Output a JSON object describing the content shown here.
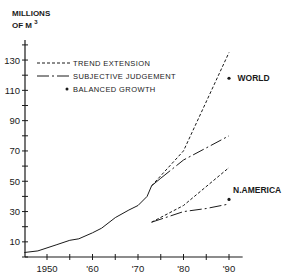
{
  "chart_data": {
    "type": "line",
    "title": "",
    "ylabel_line1": "MILLIONS",
    "ylabel_line2": "OF M",
    "ylabel_sup": "3",
    "xlabel": "",
    "xlim": [
      1945,
      1993
    ],
    "ylim": [
      0,
      150
    ],
    "grid": false,
    "x_ticks": [
      1950,
      1955,
      1960,
      1965,
      1970,
      1975,
      1980,
      1985,
      1990
    ],
    "x_tick_labels": [
      {
        "year": 1950,
        "label": "1950"
      },
      {
        "year": 1960,
        "label": "'60"
      },
      {
        "year": 1970,
        "label": "'70"
      },
      {
        "year": 1980,
        "label": "'80"
      },
      {
        "year": 1990,
        "label": "'90"
      }
    ],
    "y_ticks": [
      0,
      10,
      20,
      30,
      40,
      50,
      60,
      70,
      80,
      90,
      100,
      110,
      120,
      130,
      140
    ],
    "y_tick_labels": [
      10,
      30,
      50,
      70,
      90,
      110,
      130
    ],
    "legend": {
      "position": "upper-left",
      "entries": [
        {
          "style": "dashed",
          "label": "TREND EXTENSION"
        },
        {
          "style": "dash-dot",
          "label": "SUBJECTIVE JUDGEMENT"
        },
        {
          "style": "dot",
          "label": "BALANCED GROWTH"
        }
      ]
    },
    "series": [
      {
        "name": "World (historical)",
        "style": "solid",
        "x": [
          1945,
          1948,
          1950,
          1952,
          1955,
          1957,
          1960,
          1962,
          1965,
          1968,
          1970,
          1972,
          1973,
          1975
        ],
        "y": [
          3,
          4,
          6,
          8,
          11,
          12,
          16,
          19,
          26,
          31,
          34,
          40,
          47,
          52
        ]
      },
      {
        "name": "World - Trend extension",
        "style": "dashed",
        "x": [
          1973,
          1980,
          1990
        ],
        "y": [
          47,
          70,
          135
        ]
      },
      {
        "name": "World - Subjective judgement",
        "style": "dash-dot",
        "x": [
          1975,
          1980,
          1985,
          1990
        ],
        "y": [
          52,
          64,
          72,
          80
        ]
      },
      {
        "name": "World - Balanced growth",
        "style": "dot",
        "x": [
          1990
        ],
        "y": [
          118
        ]
      },
      {
        "name": "N. America - Trend extension",
        "style": "dashed",
        "x": [
          1973,
          1980,
          1990
        ],
        "y": [
          23,
          34,
          59
        ]
      },
      {
        "name": "N. America - Subjective judgement",
        "style": "dash-dot",
        "x": [
          1973,
          1980,
          1985,
          1990
        ],
        "y": [
          23,
          30,
          32,
          35
        ]
      },
      {
        "name": "N. America - Balanced growth",
        "style": "dot",
        "x": [
          1990
        ],
        "y": [
          38
        ]
      }
    ],
    "annotations": [
      {
        "text": "WORLD",
        "x": 1991,
        "y": 118
      },
      {
        "text": "N.AMERICA",
        "x": 1990,
        "y": 44
      }
    ]
  },
  "colors": {
    "ink": "#1a1a1a",
    "background": "#ffffff"
  }
}
